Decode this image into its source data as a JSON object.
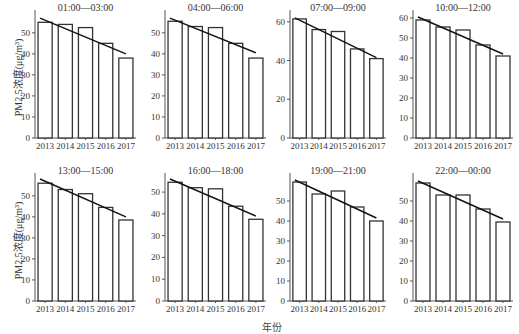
{
  "figure": {
    "ylabel": "PM2.5浓度(μg/m³)",
    "xlabel": "年份"
  },
  "chart_data": [
    {
      "type": "bar",
      "title": "01:00—03:00",
      "categories": [
        "2013",
        "2014",
        "2015",
        "2016",
        "2017"
      ],
      "values": [
        55,
        54,
        52.5,
        45,
        38
      ],
      "trendline": {
        "start": 57,
        "end": 40
      },
      "xlabel": "年份",
      "ylabel": "PM2.5浓度(μg/m³)",
      "ylim": [
        0,
        58
      ],
      "yticks": [
        0,
        10,
        20,
        30,
        40,
        50
      ]
    },
    {
      "type": "bar",
      "title": "04:00—06:00",
      "categories": [
        "2013",
        "2014",
        "2015",
        "2016",
        "2017"
      ],
      "values": [
        55.5,
        53,
        52.5,
        45,
        38
      ],
      "trendline": {
        "start": 57,
        "end": 40.5
      },
      "xlabel": "年份",
      "ylabel": "PM2.5浓度(μg/m³)",
      "ylim": [
        0,
        58
      ],
      "yticks": [
        0,
        10,
        20,
        30,
        40,
        50
      ]
    },
    {
      "type": "bar",
      "title": "07:00—09:00",
      "categories": [
        "2013",
        "2014",
        "2015",
        "2016",
        "2017"
      ],
      "values": [
        61.5,
        56,
        55,
        46,
        41
      ],
      "trendline": {
        "start": 62,
        "end": 41.5
      },
      "xlabel": "年份",
      "ylabel": "PM2.5浓度(μg/m³)",
      "ylim": [
        0,
        63
      ],
      "yticks": [
        0,
        20,
        40,
        60
      ]
    },
    {
      "type": "bar",
      "title": "10:00—12:00",
      "categories": [
        "2013",
        "2014",
        "2015",
        "2016",
        "2017"
      ],
      "values": [
        59,
        55.5,
        54,
        46.5,
        41
      ],
      "trendline": {
        "start": 60.5,
        "end": 42
      },
      "xlabel": "年份",
      "ylabel": "PM2.5浓度(μg/m³)",
      "ylim": [
        0,
        61
      ],
      "yticks": [
        0,
        10,
        20,
        30,
        40,
        50,
        60
      ]
    },
    {
      "type": "bar",
      "title": "13:00—15:00",
      "categories": [
        "2013",
        "2014",
        "2015",
        "2016",
        "2017"
      ],
      "values": [
        56,
        53,
        51,
        44.5,
        38.5
      ],
      "trendline": {
        "start": 58,
        "end": 40
      },
      "xlabel": "年份",
      "ylabel": "PM2.5浓度(μg/m³)",
      "ylim": [
        0,
        58
      ],
      "yticks": [
        0,
        10,
        20,
        30,
        40,
        50
      ]
    },
    {
      "type": "bar",
      "title": "16:00—18:00",
      "categories": [
        "2013",
        "2014",
        "2015",
        "2016",
        "2017"
      ],
      "values": [
        54.5,
        52,
        51.5,
        43.5,
        37.5
      ],
      "trendline": {
        "start": 56,
        "end": 39
      },
      "xlabel": "年份",
      "ylabel": "PM2.5浓度(μg/m³)",
      "ylim": [
        0,
        56
      ],
      "yticks": [
        0,
        10,
        20,
        30,
        40,
        50
      ]
    },
    {
      "type": "bar",
      "title": "19:00—21:00",
      "categories": [
        "2013",
        "2014",
        "2015",
        "2016",
        "2017"
      ],
      "values": [
        59.5,
        53.5,
        55,
        47,
        40
      ],
      "trendline": {
        "start": 60.5,
        "end": 41.5
      },
      "xlabel": "年份",
      "ylabel": "PM2.5浓度(μg/m³)",
      "ylim": [
        0,
        61
      ],
      "yticks": [
        0,
        10,
        20,
        30,
        40,
        50
      ]
    },
    {
      "type": "bar",
      "title": "22:00—00:00",
      "categories": [
        "2013",
        "2014",
        "2015",
        "2016",
        "2017"
      ],
      "values": [
        59,
        53,
        53,
        46,
        39.5
      ],
      "trendline": {
        "start": 60,
        "end": 41
      },
      "xlabel": "年份",
      "ylabel": "PM2.5浓度(μg/m³)",
      "ylim": [
        0,
        61
      ],
      "yticks": [
        0,
        10,
        20,
        30,
        40,
        50
      ]
    }
  ]
}
